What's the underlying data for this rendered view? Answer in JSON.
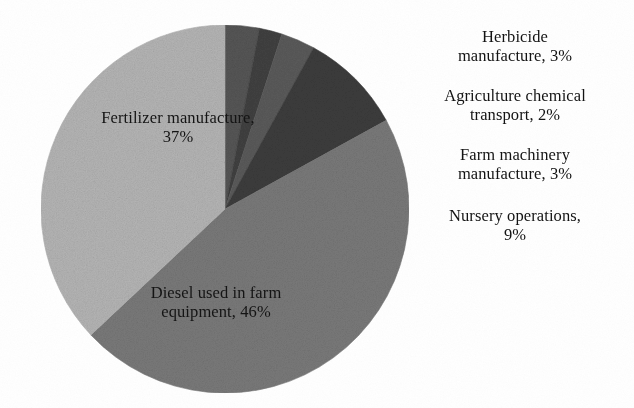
{
  "chart_data": {
    "type": "pie",
    "title": "",
    "subtitle": "",
    "legend_position": "outside-labels",
    "grid": false,
    "units": "%",
    "start_angle_deg": 0,
    "direction": "clockwise",
    "categories": [
      "Herbicide manufacture",
      "Agriculture chemical transport",
      "Farm machinery manufacture",
      "Nursery operations",
      "Diesel used in farm equipment",
      "Fertilizer manufacture"
    ],
    "values": [
      3,
      2,
      3,
      9,
      46,
      37
    ],
    "colors": [
      "#565656",
      "#414141",
      "#5b5b5b",
      "#3d3d3d",
      "#7a7a7a",
      "#b6b6b6"
    ],
    "slices": [
      {
        "name": "Herbicide manufacture",
        "value": 3,
        "value_text": "3%",
        "color": "#565656",
        "label_text": "Herbicide\nmanufacture, 3%",
        "label_placement": "outside"
      },
      {
        "name": "Agriculture chemical transport",
        "value": 2,
        "value_text": "2%",
        "color": "#414141",
        "label_text": "Agriculture chemical\ntransport, 2%",
        "label_placement": "outside"
      },
      {
        "name": "Farm machinery manufacture",
        "value": 3,
        "value_text": "3%",
        "color": "#5b5b5b",
        "label_text": "Farm machinery\nmanufacture, 3%",
        "label_placement": "outside"
      },
      {
        "name": "Nursery operations",
        "value": 9,
        "value_text": "9%",
        "color": "#3d3d3d",
        "label_text": "Nursery operations,\n9%",
        "label_placement": "outside"
      },
      {
        "name": "Diesel used in farm equipment",
        "value": 46,
        "value_text": "46%",
        "color": "#7a7a7a",
        "label_text": "Diesel used in farm\nequipment, 46%",
        "label_placement": "inside"
      },
      {
        "name": "Fertilizer manufacture",
        "value": 37,
        "value_text": "37%",
        "color": "#b6b6b6",
        "label_text": "Fertilizer manufacture,\n37%",
        "label_placement": "inside"
      }
    ]
  },
  "labels": {
    "fertilizer": "Fertilizer manufacture,\n37%",
    "diesel": "Diesel used in farm\nequipment, 46%",
    "herbicide": "Herbicide\nmanufacture, 3%",
    "agchem": "Agriculture chemical\ntransport, 2%",
    "machinery": "Farm machinery\nmanufacture, 3%",
    "nursery": "Nursery operations,\n9%"
  },
  "figure": {
    "background_color": "#ffffff",
    "text_color": "#141414"
  }
}
